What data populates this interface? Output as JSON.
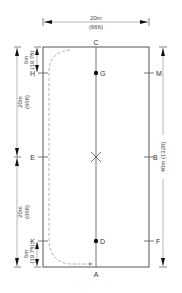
{
  "diagram": {
    "colors": {
      "line": "#555555",
      "dim_line": "#888888",
      "dashed": "#999999",
      "dot": "#111111"
    },
    "top_dimension": {
      "metric": "20m",
      "imperial": "(66ft)"
    },
    "right_dimension": {
      "label": "40m (132ft)"
    },
    "left_dimensions": [
      {
        "metric": "6m",
        "imperial": "(19.7ft)"
      },
      {
        "metric": "20m",
        "imperial": "(66ft)"
      },
      {
        "metric": "20m",
        "imperial": "(66ft)"
      },
      {
        "metric": "6m",
        "imperial": "(19.7ft)"
      }
    ],
    "markers": {
      "C": "C",
      "H": "H",
      "M": "M",
      "G": "G",
      "E": "E",
      "B": "B",
      "K": "K",
      "F": "F",
      "D": "D",
      "A": "A"
    }
  }
}
